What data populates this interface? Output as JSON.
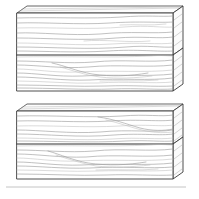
{
  "figure": {
    "title": "Two stacks of squared timber beams",
    "style": "line drawing",
    "view": "three-quarter perspective",
    "background_color": "#ffffff",
    "outline_color": "#3a3a3a",
    "grain_color": "#9a9a9a",
    "seam_color": "#2e2e2e",
    "baseline_color": "#b5b5b5",
    "stack_count": 2,
    "beams_per_stack": 2,
    "total_beams": 4
  },
  "stacks": [
    {
      "id": "upper-stack",
      "label": "Upper stack",
      "position": "top",
      "beams": [
        {
          "id": "upper-beam-top",
          "label": "Upper stack, top beam",
          "face": "front",
          "grain_lines": 9
        },
        {
          "id": "upper-beam-bottom",
          "label": "Upper stack, bottom beam",
          "face": "front",
          "grain_lines": 11
        }
      ],
      "geometry": {
        "front_left_x": 17,
        "front_right_x": 173,
        "top_y": 13,
        "seam_y": 55,
        "bottom_y": 91,
        "depth_dx": 10,
        "depth_dy": 7
      }
    },
    {
      "id": "lower-stack",
      "label": "Lower stack",
      "position": "bottom",
      "beams": [
        {
          "id": "lower-beam-top",
          "label": "Lower stack, top beam",
          "face": "front",
          "grain_lines": 9
        },
        {
          "id": "lower-beam-bottom",
          "label": "Lower stack, bottom beam",
          "face": "front",
          "grain_lines": 11
        }
      ],
      "geometry": {
        "front_left_x": 17,
        "front_right_x": 173,
        "top_y": 111,
        "seam_y": 144,
        "bottom_y": 179,
        "depth_dx": 10,
        "depth_dy": 7
      }
    }
  ],
  "baseline": {
    "id": "ground-rule",
    "label": "Faint horizontal ground line",
    "y": 187,
    "x_start": 6,
    "x_end": 186
  }
}
